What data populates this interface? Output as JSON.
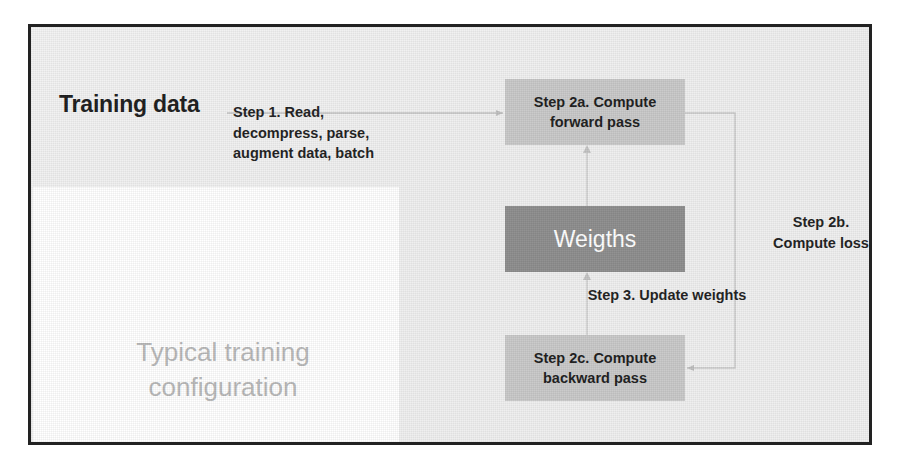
{
  "slide": {
    "headings": {
      "training_data": "Training data",
      "typical_configuration": "Typical training\nconfiguration"
    },
    "labels": {
      "step1": "Step 1. Read, decompress, parse, augment data, batch",
      "step2b": "Step 2b. Compute loss",
      "step3": "Step 3. Update weights"
    },
    "boxes": [
      {
        "id": "forward",
        "text": "Step 2a. Compute forward pass",
        "fill": "#c9c9c9",
        "text_color": "#1d1d1d"
      },
      {
        "id": "weights",
        "text": "Weigths",
        "fill": "#8e8e8e",
        "text_color": "#ffffff"
      },
      {
        "id": "backward",
        "text": "Step 2c. Compute backward pass",
        "fill": "#c9c9c9",
        "text_color": "#1d1d1d"
      }
    ],
    "watermarks": {
      "left": "",
      "right": ""
    },
    "colors": {
      "frame_border": "#222222",
      "slide_background": "#f0f0f0",
      "white_panel": "#ffffff",
      "box_light": "#c9c9c9",
      "box_dark": "#8e8e8e",
      "muted_heading": "#b8b8b8",
      "connector": "#c2c2c2"
    }
  }
}
